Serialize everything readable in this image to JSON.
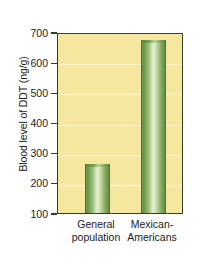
{
  "chart_data": {
    "type": "bar",
    "title": "",
    "xlabel": "",
    "ylabel": "Blood level of DDT (ng/g)",
    "categories": [
      "General population",
      "Mexican-Americans"
    ],
    "category_lines": [
      [
        "General",
        "population"
      ],
      [
        "Mexican-",
        "Americans"
      ]
    ],
    "values": [
      262,
      675
    ],
    "ylim": [
      100,
      700
    ],
    "yticks": [
      100,
      200,
      300,
      400,
      500,
      600,
      700
    ],
    "ytick_labels": [
      "100",
      "200",
      "300",
      "400",
      "500",
      "600",
      "700"
    ],
    "grid": true,
    "legend": null,
    "colors": {
      "plot_background": "#f5e79e",
      "page_background": "#ffffff",
      "bar_dark": "#5d8c44",
      "bar_light": "#e7f0d8",
      "axis": "#3a3a28",
      "text": "#1b1b1b",
      "gridline": "#fdf6c9"
    }
  }
}
